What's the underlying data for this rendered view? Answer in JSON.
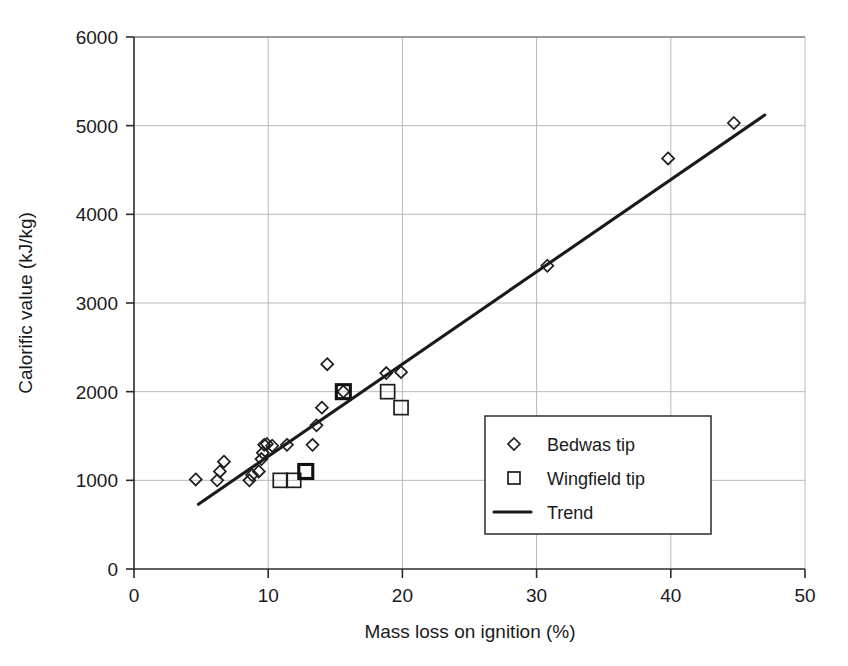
{
  "chart_data": {
    "type": "scatter",
    "title": "",
    "xlabel": "Mass loss on ignition (%)",
    "ylabel": "Calorific value (kJ/kg)",
    "xlim": [
      0,
      50
    ],
    "ylim": [
      0,
      6000
    ],
    "xticks": [
      0,
      10,
      20,
      30,
      40,
      50
    ],
    "yticks": [
      0,
      1000,
      2000,
      3000,
      4000,
      5000,
      6000
    ],
    "xtick_labels": [
      "0",
      "10",
      "20",
      "30",
      "40",
      "50"
    ],
    "ytick_labels": [
      "0",
      "1000",
      "2000",
      "3000",
      "4000",
      "5000",
      "6000"
    ],
    "grid": true,
    "grid_color": "#b9b9b9",
    "legend_position": "center-right",
    "series": [
      {
        "name": "Bedwas tip",
        "marker": "diamond",
        "color": "#1d1d1d",
        "points": [
          [
            4.6,
            1010
          ],
          [
            6.2,
            1000
          ],
          [
            6.4,
            1100
          ],
          [
            6.7,
            1210
          ],
          [
            8.6,
            1000
          ],
          [
            8.8,
            1060
          ],
          [
            9.3,
            1100
          ],
          [
            9.5,
            1240
          ],
          [
            9.6,
            1310
          ],
          [
            9.7,
            1400
          ],
          [
            9.9,
            1410
          ],
          [
            10.3,
            1390
          ],
          [
            11.4,
            1400
          ],
          [
            13.3,
            1400
          ],
          [
            13.6,
            1620
          ],
          [
            14.0,
            1820
          ],
          [
            14.4,
            2310
          ],
          [
            15.6,
            2000
          ],
          [
            18.8,
            2210
          ],
          [
            19.9,
            2220
          ],
          [
            30.8,
            3420
          ],
          [
            39.8,
            4630
          ],
          [
            44.7,
            5030
          ]
        ]
      },
      {
        "name": "Wingfield tip",
        "marker": "square",
        "color": "#1d1d1d",
        "points": [
          [
            10.9,
            1000
          ],
          [
            11.9,
            1000
          ],
          [
            12.8,
            1100
          ],
          [
            15.6,
            2000
          ],
          [
            18.9,
            2000
          ],
          [
            19.9,
            1820
          ]
        ]
      },
      {
        "name": "Trend",
        "marker": "line",
        "color": "#1a1a1a",
        "points": [
          [
            4.8,
            730
          ],
          [
            47.0,
            5120
          ]
        ]
      }
    ]
  },
  "legend": {
    "entries": [
      {
        "label": "Bedwas tip",
        "symbol": "diamond"
      },
      {
        "label": "Wingfield tip",
        "symbol": "square"
      },
      {
        "label": "Trend",
        "symbol": "line"
      }
    ]
  }
}
